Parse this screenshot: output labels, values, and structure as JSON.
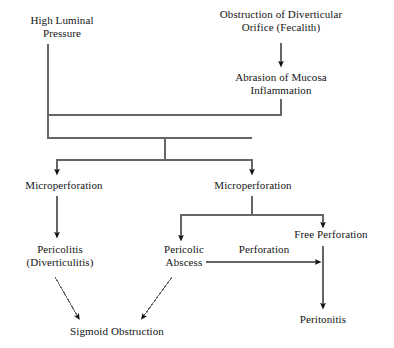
{
  "diagram": {
    "type": "flowchart",
    "background_color": "#ffffff",
    "line_color": "#555555",
    "text_color": "#141414",
    "nodes": [
      {
        "id": "high-luminal-pressure",
        "label": "High Luminal\nPressure",
        "x": 16,
        "y": 14,
        "w": 92
      },
      {
        "id": "obstruction-diverticular-orifice",
        "label": "Obstruction of Diverticular\nOrifice (Fecalith)",
        "x": 207,
        "y": 8,
        "w": 148
      },
      {
        "id": "abrasion-mucosa-inflammation",
        "label": "Abrasion of Mucosa\nInflammation",
        "x": 219,
        "y": 71,
        "w": 124
      },
      {
        "id": "microperforation-left",
        "label": "Microperforation",
        "x": 14,
        "y": 179,
        "w": 100
      },
      {
        "id": "microperforation-right",
        "label": "Microperforation",
        "x": 203,
        "y": 179,
        "w": 100
      },
      {
        "id": "pericolitis-diverticulitis",
        "label": "Pericolitis\n(Diverticulitis)",
        "x": 11,
        "y": 243,
        "w": 98
      },
      {
        "id": "pericolic-abscess",
        "label": "Pericolic\nAbscess",
        "x": 150,
        "y": 243,
        "w": 68
      },
      {
        "id": "free-perforation",
        "label": "Free Perforation",
        "x": 281,
        "y": 228,
        "w": 100
      },
      {
        "id": "sigmoid-obstruction",
        "label": "Sigmoid Obstruction",
        "x": 54,
        "y": 325,
        "w": 126
      },
      {
        "id": "peritonitis",
        "label": "Peritonitis",
        "x": 292,
        "y": 313,
        "w": 62
      }
    ],
    "edge_labels": [
      {
        "id": "perforation",
        "label": "Perforation",
        "x": 228,
        "y": 243,
        "w": 72
      }
    ],
    "connections": [
      {
        "id": "obstruction-to-abrasion",
        "from": "obstruction-diverticular-orifice",
        "to": "abrasion-mucosa-inflammation",
        "kind": "vertical-arrow"
      },
      {
        "id": "high-pressure-to-junction",
        "from": "high-luminal-pressure",
        "to": "split-junction",
        "kind": "elbow"
      },
      {
        "id": "abrasion-to-junction",
        "from": "abrasion-mucosa-inflammation",
        "to": "split-junction",
        "kind": "elbow"
      },
      {
        "id": "junction-to-microperforation-left",
        "from": "split-junction",
        "to": "microperforation-left",
        "kind": "elbow-arrow"
      },
      {
        "id": "junction-to-microperforation-right",
        "from": "split-junction",
        "to": "microperforation-right",
        "kind": "elbow-arrow"
      },
      {
        "id": "microperforation-left-to-pericolitis",
        "from": "microperforation-left",
        "to": "pericolitis-diverticulitis",
        "kind": "vertical-arrow"
      },
      {
        "id": "microperforation-right-to-pericolic-abscess",
        "from": "microperforation-right",
        "to": "pericolic-abscess",
        "kind": "elbow-arrow"
      },
      {
        "id": "microperforation-right-to-free-perforation",
        "from": "microperforation-right",
        "to": "free-perforation",
        "kind": "elbow-arrow"
      },
      {
        "id": "pericolic-abscess-to-free-perforation",
        "from": "pericolic-abscess",
        "to": "free-perforation",
        "kind": "horizontal-arrow",
        "label": "Perforation"
      },
      {
        "id": "pericolitis-to-sigmoid-obstruction",
        "from": "pericolitis-diverticulitis",
        "to": "sigmoid-obstruction",
        "kind": "diagonal-arrow"
      },
      {
        "id": "pericolic-abscess-to-sigmoid-obstruction",
        "from": "pericolic-abscess",
        "to": "sigmoid-obstruction",
        "kind": "diagonal-arrow"
      },
      {
        "id": "free-perforation-to-peritonitis",
        "from": "free-perforation",
        "to": "peritonitis",
        "kind": "vertical-arrow"
      }
    ]
  }
}
